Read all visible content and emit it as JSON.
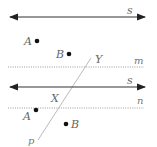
{
  "diagram": {
    "type": "geometry-parallel-lines",
    "panels": [
      {
        "name": "top-panel",
        "line_s": {
          "label": "s",
          "style": "solid-double-arrow",
          "y": 17
        },
        "line_m": {
          "label": "m",
          "style": "dotted",
          "y": 67
        },
        "points": [
          {
            "label": "A",
            "x": 37,
            "y": 41
          },
          {
            "label": "B",
            "x": 69,
            "y": 54
          }
        ],
        "intersection_label": "Y"
      },
      {
        "name": "bottom-panel",
        "line_s": {
          "label": "s",
          "style": "solid-double-arrow",
          "y": 87
        },
        "line_n": {
          "label": "n",
          "style": "dotted",
          "y": 108
        },
        "points": [
          {
            "label": "A",
            "x": 36,
            "y": 110
          },
          {
            "label": "B",
            "x": 66,
            "y": 124
          }
        ],
        "intersection_label": "X",
        "transversal": {
          "label": "p"
        }
      }
    ],
    "colors": {
      "line": "#333333",
      "dotted": "#999999",
      "transversal": "#bbbbbb",
      "label": "#666666",
      "point": "#111111"
    }
  }
}
